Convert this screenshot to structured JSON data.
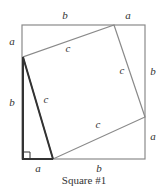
{
  "figure": {
    "caption": "Square #1",
    "colors": {
      "outer_square": "#8a8a8a",
      "inner_square": "#8a8a8a",
      "triangle": "#333333",
      "text": "#333333"
    },
    "outer_square": {
      "x": 22,
      "y": 25,
      "w": 123,
      "h": 134
    },
    "inner_square_points": [
      [
        114,
        25
      ],
      [
        145,
        117
      ],
      [
        53,
        159
      ],
      [
        23,
        57
      ]
    ],
    "highlight_triangle_points": [
      [
        23,
        57
      ],
      [
        23,
        159
      ],
      [
        53,
        159
      ]
    ],
    "right_angle_marker": {
      "x": 23,
      "y": 152,
      "size": 7
    },
    "labels": {
      "top_b": "b",
      "top_a": "a",
      "left_a": "a",
      "left_b": "b",
      "right_b": "b",
      "right_a": "a",
      "bottom_a": "a",
      "bottom_b": "b",
      "c_top": "c",
      "c_right": "c",
      "c_bottom": "c",
      "c_left": "c"
    }
  }
}
